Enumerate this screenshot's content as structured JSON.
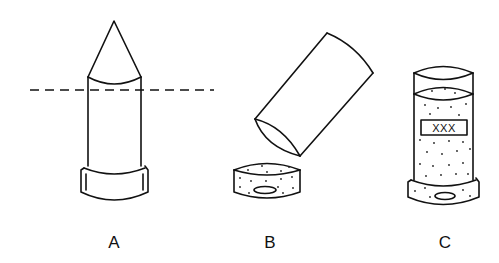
{
  "figure": {
    "panels": [
      {
        "id": "A",
        "label": "A",
        "description": "Tube with conical tip and cap; dashed cut line across upper body"
      },
      {
        "id": "B",
        "label": "B",
        "description": "Cut tube tilted above a stippled cap disc"
      },
      {
        "id": "C",
        "label": "C",
        "description": "Tube filled with stippled material on cap, labeled box"
      }
    ],
    "box_text": "XXX"
  },
  "colors": {
    "line": "#111111",
    "background": "#ffffff"
  }
}
